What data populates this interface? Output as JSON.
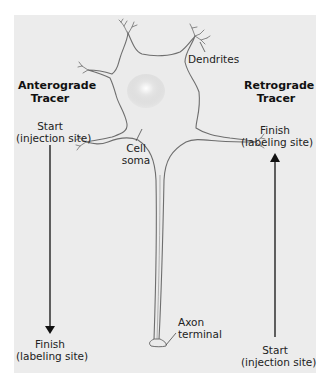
{
  "colors": {
    "page_background": "#ffffff",
    "panel_background": "#ececec",
    "neuron_outline": "#6e6e6e",
    "neuron_fill": "#ebebeb",
    "arrow": "#111111"
  },
  "diagram": {
    "anterograde": {
      "heading_line1": "Anterograde",
      "heading_line2": "Tracer",
      "start_line1": "Start",
      "start_line2": "(injection site)",
      "finish_line1": "Finish",
      "finish_line2": "(labeling site)",
      "arrow_direction": "down"
    },
    "retrograde": {
      "heading_line1": "Retrograde",
      "heading_line2": "Tracer",
      "finish_line1": "Finish",
      "finish_line2": "(labeling site)",
      "start_line1": "Start",
      "start_line2": "(injection site)",
      "arrow_direction": "up"
    },
    "neuron_labels": {
      "dendrites": "Dendrites",
      "cell_soma_line1": "Cell",
      "cell_soma_line2": "soma",
      "axon_terminal_line1": "Axon",
      "axon_terminal_line2": "terminal"
    }
  }
}
